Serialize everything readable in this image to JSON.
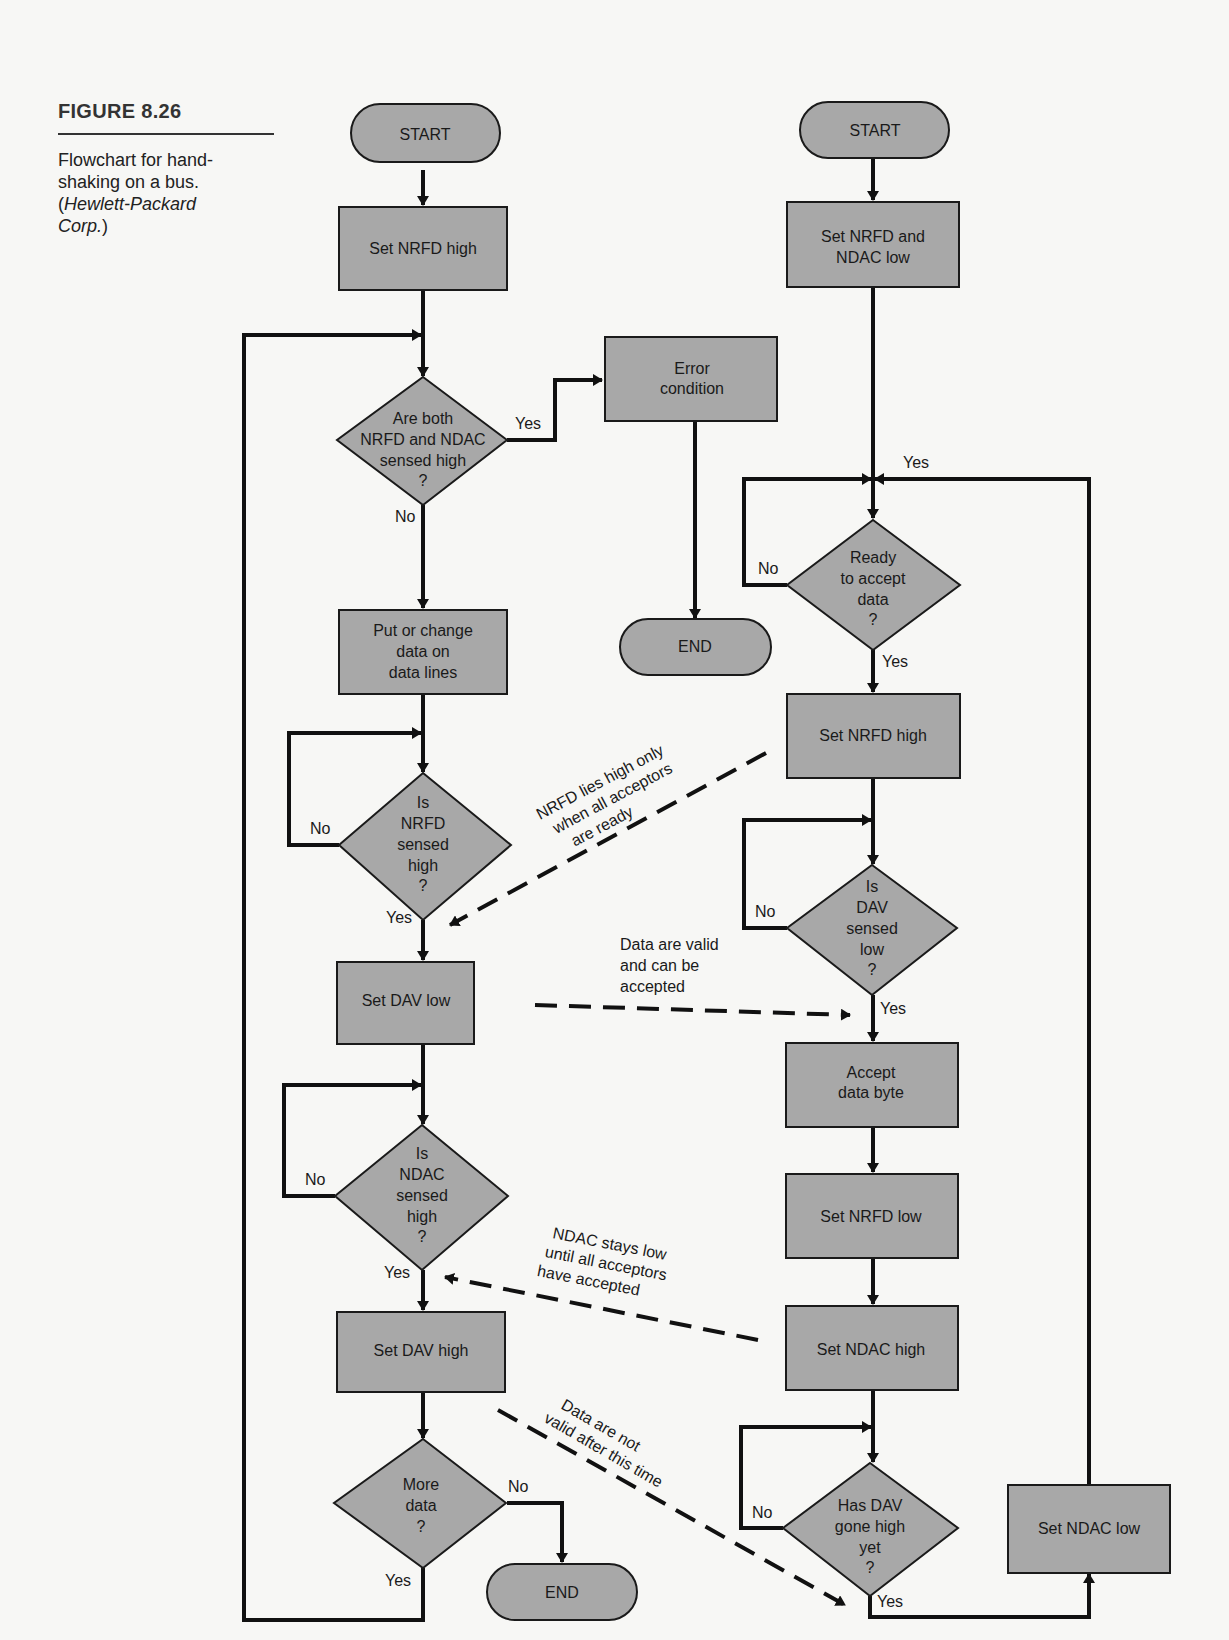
{
  "caption": {
    "figure": "FIGURE 8.26",
    "line1": "Flowchart for hand-",
    "line2": "shaking on a bus.",
    "source": "Hewlett-Packard",
    "source2": "Corp.",
    "paren_open": "(",
    "paren_close": ")"
  },
  "colors": {
    "shape_fill": "#a8a8a8",
    "line": "#111111",
    "background": "#f7f7f5"
  },
  "talker": {
    "start": "START",
    "set_nrfd_high": "Set NRFD high",
    "check_both": [
      "Are both",
      "NRFD and NDAC",
      "sensed high",
      "?"
    ],
    "error": [
      "Error",
      "condition"
    ],
    "error_end": "END",
    "put_data": [
      "Put or change",
      "data on",
      "data lines"
    ],
    "is_nrfd_high": [
      "Is",
      "NRFD",
      "sensed",
      "high",
      "?"
    ],
    "set_dav_low": "Set DAV low",
    "is_ndac_high": [
      "Is",
      "NDAC",
      "sensed",
      "high",
      "?"
    ],
    "set_dav_high": "Set DAV high",
    "more_data": [
      "More",
      "data",
      "?"
    ],
    "end": "END"
  },
  "listener": {
    "start": "START",
    "set_nrfd_ndac_low": [
      "Set NRFD and",
      "NDAC low"
    ],
    "ready": [
      "Ready",
      "to accept",
      "data",
      "?"
    ],
    "set_nrfd_high": "Set NRFD high",
    "is_dav_low": [
      "Is",
      "DAV",
      "sensed",
      "low",
      "?"
    ],
    "accept": [
      "Accept",
      "data byte"
    ],
    "set_nrfd_low": "Set NRFD low",
    "set_ndac_high": "Set NDAC high",
    "dav_gone_high": [
      "Has DAV",
      "gone high",
      "yet",
      "?"
    ],
    "set_ndac_low": "Set NDAC low"
  },
  "labels": {
    "yes": "Yes",
    "no": "No"
  },
  "notes": {
    "nrfd": [
      "NRFD lies high only",
      "when all acceptors",
      "are ready"
    ],
    "valid": [
      "Data are valid",
      "and can be",
      "accepted"
    ],
    "ndac": [
      "NDAC stays low",
      "until all acceptors",
      "have accepted"
    ],
    "not_valid": [
      "Data are not",
      "valid after this time"
    ]
  }
}
